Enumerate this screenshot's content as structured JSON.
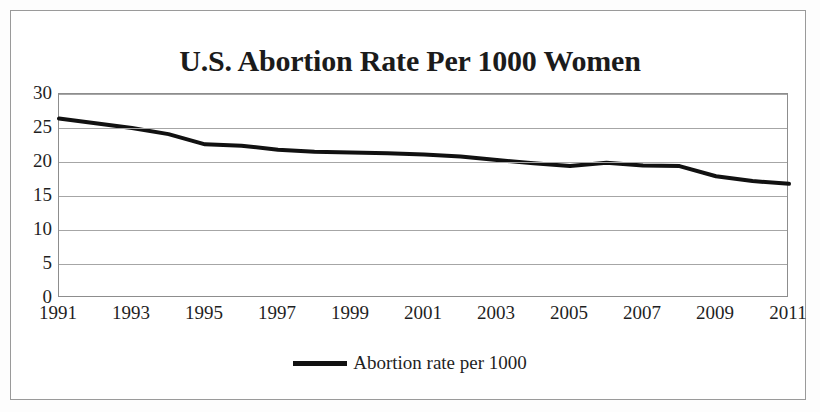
{
  "chart_data": {
    "type": "line",
    "title": "U.S. Abortion Rate Per 1000 Women",
    "xlabel": "",
    "ylabel": "",
    "ylim": [
      0,
      30
    ],
    "ytick_values": [
      30,
      25,
      20,
      15,
      10,
      5,
      0
    ],
    "ytick_labels": [
      "30",
      "25",
      "20",
      "15",
      "10",
      "5",
      "0"
    ],
    "xlim": [
      1991,
      2011
    ],
    "xtick_labels": [
      "1991",
      "1993",
      "1995",
      "1997",
      "1999",
      "2001",
      "2003",
      "2005",
      "2007",
      "2009",
      "2011"
    ],
    "x": [
      1991,
      1992,
      1993,
      1994,
      1995,
      1996,
      1997,
      1998,
      1999,
      2000,
      2001,
      2002,
      2003,
      2004,
      2005,
      2006,
      2007,
      2008,
      2009,
      2010,
      2011
    ],
    "categories": [
      "1991",
      "1992",
      "1993",
      "1994",
      "1995",
      "1996",
      "1997",
      "1998",
      "1999",
      "2000",
      "2001",
      "2002",
      "2003",
      "2004",
      "2005",
      "2006",
      "2007",
      "2008",
      "2009",
      "2010",
      "2011"
    ],
    "series": [
      {
        "name": "Abortion rate per 1000",
        "color": "#111111",
        "values": [
          26.4,
          25.7,
          25.0,
          24.1,
          22.6,
          22.4,
          21.8,
          21.5,
          21.4,
          21.3,
          21.1,
          20.8,
          20.3,
          19.8,
          19.4,
          19.9,
          19.5,
          19.4,
          17.9,
          17.2,
          16.8
        ]
      }
    ],
    "legend": {
      "position": "bottom",
      "entries": [
        "Abortion rate per 1000"
      ]
    },
    "grid": {
      "horizontal": true,
      "vertical": false,
      "color": "#a6a6a6"
    },
    "plot_border_color": "#8d8d8d",
    "figure_border_color": "#9a9a9a",
    "background_color": "#ffffff"
  },
  "legend": {
    "label": "Abortion rate per 1000"
  }
}
